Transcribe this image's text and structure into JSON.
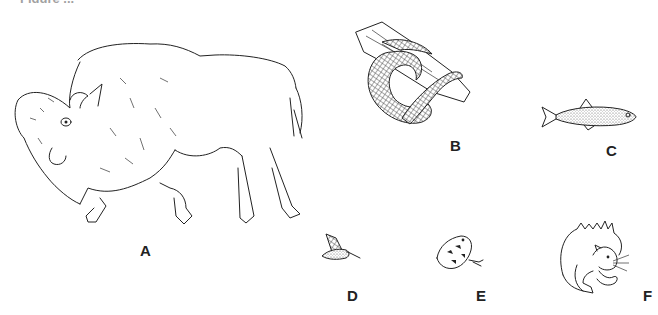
{
  "figure": {
    "caption_partial": "Figure ...",
    "animals": [
      {
        "label": "A",
        "name": "bison"
      },
      {
        "label": "B",
        "name": "snake"
      },
      {
        "label": "C",
        "name": "fish"
      },
      {
        "label": "D",
        "name": "hummingbird"
      },
      {
        "label": "E",
        "name": "frog"
      },
      {
        "label": "F",
        "name": "squirrel"
      }
    ]
  }
}
